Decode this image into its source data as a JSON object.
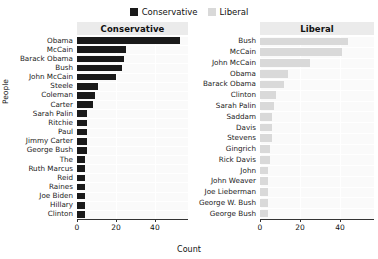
{
  "legend": {
    "items": [
      {
        "label": "Conservative",
        "color": "#1a1a1a"
      },
      {
        "label": "Liberal",
        "color": "#d9d9d9"
      }
    ]
  },
  "axes": {
    "xlabel": "Count",
    "ylabel": "People",
    "xticks": [
      "0",
      "20",
      "40"
    ],
    "xlim": [
      0,
      57
    ]
  },
  "chart_data": {
    "type": "bar",
    "orientation": "horizontal",
    "title": "",
    "xlabel": "Count",
    "ylabel": "People",
    "xlim": [
      0,
      57
    ],
    "xticks": [
      0,
      20,
      40
    ],
    "grid": true,
    "legend_position": "top-center",
    "facets": [
      {
        "name": "Conservative",
        "color": "#1a1a1a",
        "categories": [
          "Obama",
          "McCain",
          "Barack Obama",
          "Bush",
          "John McCain",
          "Steele",
          "Coleman",
          "Carter",
          "Sarah Palin",
          "Ritchie",
          "Paul",
          "Jimmy Carter",
          "George Bush",
          "The",
          "Ruth Marcus",
          "Reid",
          "Raines",
          "Joe Biden",
          "Hillary",
          "Clinton"
        ],
        "values": [
          53,
          25,
          24,
          23,
          20,
          11,
          9,
          8,
          5,
          5,
          5,
          5,
          5,
          4,
          4,
          4,
          4,
          4,
          4,
          4
        ]
      },
      {
        "name": "Liberal",
        "color": "#d9d9d9",
        "categories": [
          "Bush",
          "McCain",
          "John McCain",
          "Obama",
          "Barack Obama",
          "Clinton",
          "Sarah Palin",
          "Saddam",
          "Davis",
          "Stevens",
          "Gingrich",
          "Rick Davis",
          "John",
          "John Weaver",
          "Joe Lieberman",
          "George W. Bush",
          "George Bush"
        ],
        "values": [
          44,
          41,
          25,
          14,
          12,
          8,
          7,
          6,
          6,
          6,
          5,
          5,
          4,
          4,
          4,
          4,
          4
        ]
      }
    ]
  }
}
